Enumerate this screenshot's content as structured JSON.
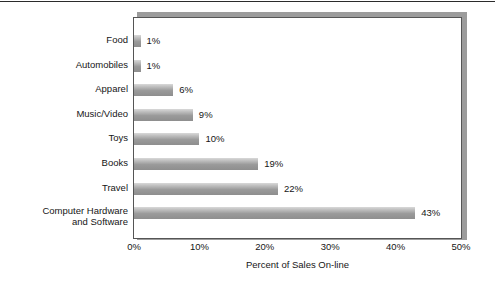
{
  "chart_data": {
    "type": "bar",
    "orientation": "horizontal",
    "title": "",
    "xlabel": "Percent of Sales On-line",
    "ylabel": "",
    "xlim": [
      0,
      50
    ],
    "xticks": [
      "0%",
      "10%",
      "20%",
      "30%",
      "40%",
      "50%"
    ],
    "xtick_values": [
      0,
      10,
      20,
      30,
      40,
      50
    ],
    "grid": false,
    "legend": false,
    "categories": [
      "Food",
      "Automobiles",
      "Apparel",
      "Music/Video",
      "Toys",
      "Books",
      "Travel",
      "Computer Hardware\nand Software"
    ],
    "values": [
      1,
      1,
      6,
      9,
      10,
      19,
      22,
      43
    ],
    "data_labels": [
      "1%",
      "1%",
      "6%",
      "9%",
      "10%",
      "19%",
      "22%",
      "43%"
    ],
    "bar_color_top": "#d9d9d9",
    "bar_color_bottom": "#8e8e8e",
    "frame_color": "#555555",
    "shadow_color": "#9c9c9c"
  }
}
